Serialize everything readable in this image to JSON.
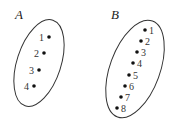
{
  "sets": [
    {
      "name": "A",
      "label_pos": [
        15,
        19
      ],
      "ellipse": {
        "cx": 39,
        "cy": 63,
        "rx": 22,
        "ry": 45,
        "rotate": 18
      },
      "points": [
        {
          "label": "1",
          "x": 49,
          "y": 37,
          "label_side": "left"
        },
        {
          "label": "2",
          "x": 44,
          "y": 53,
          "label_side": "left"
        },
        {
          "label": "3",
          "x": 39,
          "y": 70,
          "label_side": "left"
        },
        {
          "label": "4",
          "x": 34,
          "y": 86,
          "label_side": "left"
        }
      ]
    },
    {
      "name": "B",
      "label_pos": [
        111,
        19
      ],
      "ellipse": {
        "cx": 135,
        "cy": 69,
        "rx": 25,
        "ry": 51,
        "rotate": 20
      },
      "points": [
        {
          "label": "1",
          "x": 145,
          "y": 30,
          "label_side": "right"
        },
        {
          "label": "2",
          "x": 141,
          "y": 41,
          "label_side": "right"
        },
        {
          "label": "3",
          "x": 137,
          "y": 52,
          "label_side": "right"
        },
        {
          "label": "4",
          "x": 133,
          "y": 63,
          "label_side": "right"
        },
        {
          "label": "5",
          "x": 129,
          "y": 75,
          "label_side": "right"
        },
        {
          "label": "6",
          "x": 125,
          "y": 86,
          "label_side": "right"
        },
        {
          "label": "7",
          "x": 121,
          "y": 97,
          "label_side": "right"
        },
        {
          "label": "8",
          "x": 117,
          "y": 108,
          "label_side": "right"
        }
      ]
    }
  ],
  "colors": {
    "stroke": "#333333",
    "dot": "#111111"
  }
}
